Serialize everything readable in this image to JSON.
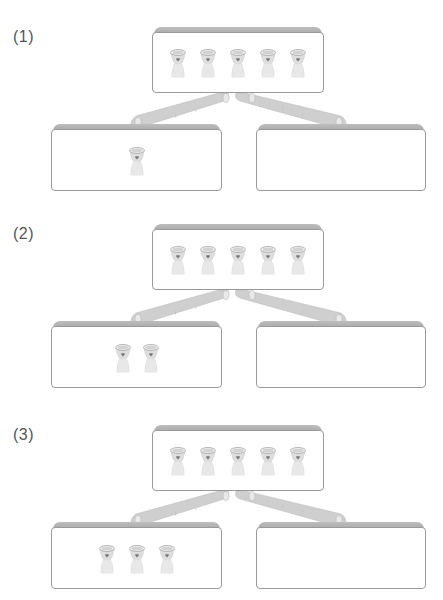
{
  "problems": [
    {
      "label": "(1)",
      "top_cups": 5,
      "left_cups": 1,
      "right_cups": 0
    },
    {
      "label": "(2)",
      "top_cups": 5,
      "left_cups": 2,
      "right_cups": 0
    },
    {
      "label": "(3)",
      "top_cups": 5,
      "left_cups": 3,
      "right_cups": 0
    }
  ],
  "icons": {
    "cup": "cup-with-heart-icon"
  },
  "colors": {
    "box_border": "#9a9a9a",
    "box_cap": "#b3b3b3",
    "cup": "#d9d9d9",
    "heart": "#7a7a7a"
  }
}
